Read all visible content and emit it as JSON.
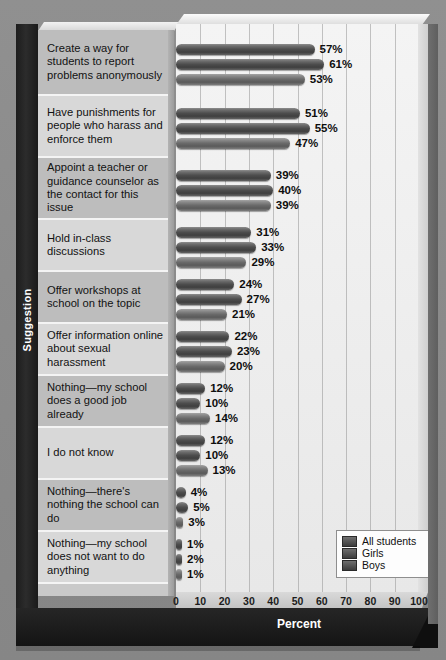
{
  "chart_data": {
    "type": "bar",
    "orientation": "horizontal",
    "title": "",
    "xlabel": "Percent",
    "ylabel": "Suggestion",
    "xlim": [
      0,
      100
    ],
    "xticks": [
      0,
      10,
      20,
      30,
      40,
      50,
      60,
      70,
      80,
      90,
      100
    ],
    "grid": true,
    "legend_position": "bottom-right",
    "value_suffix": "%",
    "categories": [
      "Create a way for students to report problems anonymously",
      "Have punishments for people who harass and enforce them",
      "Appoint a teacher or guidance counselor as the contact for this issue",
      "Hold in-class discussions",
      "Offer workshops at school on the topic",
      "Offer information online about sexual harassment",
      "Nothing—my school does a good job already",
      "I do not know",
      "Nothing—there's nothing the school can do",
      "Nothing—my school does not want to do anything"
    ],
    "series": [
      {
        "name": "All students",
        "values": [
          57,
          51,
          39,
          31,
          24,
          22,
          12,
          12,
          4,
          1
        ]
      },
      {
        "name": "Girls",
        "values": [
          61,
          55,
          40,
          33,
          27,
          23,
          10,
          10,
          5,
          2
        ]
      },
      {
        "name": "Boys",
        "values": [
          53,
          47,
          39,
          29,
          21,
          20,
          14,
          13,
          3,
          1
        ]
      }
    ],
    "labels": {
      "Create a way for students to report problems anonymously": [
        "57%",
        "61%",
        "53%"
      ],
      "Have punishments for people who harass and enforce them": [
        "51%",
        "55%",
        "47%"
      ],
      "Appoint a teacher or guidance counselor as the contact for this issue": [
        "39%",
        "40%",
        "39%"
      ],
      "Hold in-class discussions": [
        "31%",
        "33%",
        "29%"
      ],
      "Offer workshops at school on the topic": [
        "24%",
        "27%",
        "21%"
      ],
      "Offer information online about sexual harassment": [
        "22%",
        "23%",
        "20%"
      ],
      "Nothing—my school does a good job already": [
        "12%",
        "10%",
        "14%"
      ],
      "I do not know": [
        "12%",
        "10%",
        "13%"
      ],
      "Nothing—there's nothing the school can do": [
        "4%",
        "5%",
        "3%"
      ],
      "Nothing—my school does not want to do anything": [
        "1%",
        "2%",
        "1%"
      ]
    },
    "colors": {
      "all_students": "#4d4d4d",
      "girls": "#4d4d4d",
      "boys": "#6a6a6a",
      "background": "#8e8e8e",
      "plot_background": "#efefef",
      "frame": "#1d1d1d"
    }
  },
  "axis": {
    "x_title": "Percent",
    "y_title": "Suggestion",
    "ticks": [
      "0",
      "10",
      "20",
      "30",
      "40",
      "50",
      "60",
      "70",
      "80",
      "90",
      "100"
    ]
  },
  "legend": {
    "entries": [
      {
        "label": "All students"
      },
      {
        "label": "Girls"
      },
      {
        "label": "Boys"
      }
    ]
  },
  "rows": [
    {
      "label": "Create a way for students to report problems anonymously",
      "values": [
        "57%",
        "61%",
        "53%"
      ],
      "nums": [
        57,
        61,
        53
      ]
    },
    {
      "label": "Have punishments for people who harass and enforce them",
      "values": [
        "51%",
        "55%",
        "47%"
      ],
      "nums": [
        51,
        55,
        47
      ]
    },
    {
      "label": "Appoint a teacher or guidance counselor as the contact for this issue",
      "values": [
        "39%",
        "40%",
        "39%"
      ],
      "nums": [
        39,
        40,
        39
      ]
    },
    {
      "label": "Hold in-class discussions",
      "values": [
        "31%",
        "33%",
        "29%"
      ],
      "nums": [
        31,
        33,
        29
      ]
    },
    {
      "label": "Offer workshops at school on the topic",
      "values": [
        "24%",
        "27%",
        "21%"
      ],
      "nums": [
        24,
        27,
        21
      ]
    },
    {
      "label": "Offer information online about sexual harassment",
      "values": [
        "22%",
        "23%",
        "20%"
      ],
      "nums": [
        22,
        23,
        20
      ]
    },
    {
      "label": "Nothing—my school does a good job already",
      "values": [
        "12%",
        "10%",
        "14%"
      ],
      "nums": [
        12,
        10,
        14
      ]
    },
    {
      "label": "I do not know",
      "values": [
        "12%",
        "10%",
        "13%"
      ],
      "nums": [
        12,
        10,
        13
      ]
    },
    {
      "label": "Nothing—there's nothing the school can do",
      "values": [
        "4%",
        "5%",
        "3%"
      ],
      "nums": [
        4,
        5,
        3
      ]
    },
    {
      "label": "Nothing—my school does not want to do anything",
      "values": [
        "1%",
        "2%",
        "1%"
      ],
      "nums": [
        1,
        2,
        1
      ]
    }
  ]
}
